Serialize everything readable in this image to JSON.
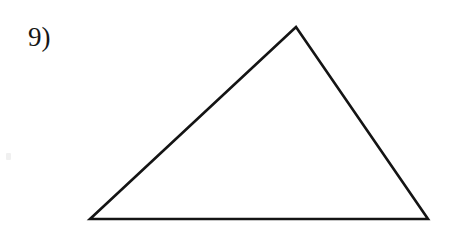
{
  "page": {
    "background_color": "#ffffff",
    "width": 458,
    "height": 237,
    "media": "scanned-worksheet"
  },
  "problem": {
    "number_label": "9)",
    "label_color": "#161616",
    "label_x": 28,
    "label_y": 24,
    "label_font_size": 27
  },
  "figure": {
    "shape_name": "triangle",
    "classification": "scalene",
    "stroke_color": "#141414",
    "stroke_width": 2.6,
    "fill": "none",
    "vertices": [
      {
        "name": "apex",
        "x": 296,
        "y": 27
      },
      {
        "name": "bottom-right",
        "x": 428,
        "y": 219
      },
      {
        "name": "bottom-left",
        "x": 90,
        "y": 219
      }
    ],
    "polygon_points": "296,27 428,219 90,219",
    "edges": [
      {
        "name": "left-side",
        "from": "bottom-left",
        "to": "apex"
      },
      {
        "name": "right-side",
        "from": "apex",
        "to": "bottom-right"
      },
      {
        "name": "base",
        "from": "bottom-left",
        "to": "bottom-right"
      }
    ],
    "base_width": 338,
    "height_px": 192
  },
  "artifacts": {
    "speck_label": "scan-speck",
    "speck_color": "#f0f0f0"
  }
}
